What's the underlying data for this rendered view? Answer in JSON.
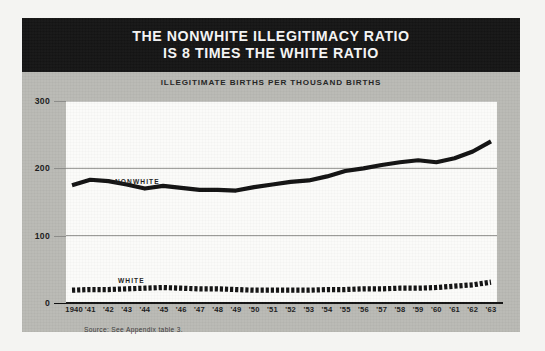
{
  "poster": {
    "title_line1": "THE NONWHITE ILLEGITIMACY RATIO",
    "title_line2": "IS 8 TIMES THE WHITE RATIO",
    "subhead": "ILLEGITIMATE BIRTHS PER THOUSAND BIRTHS",
    "source": "Source: See Appendix table 3.",
    "colors": {
      "plate": "#b9b9b4",
      "title_band": "#141414",
      "plot_background": "#fbfbf9",
      "line": "#111111",
      "grid": "#8d8d8a"
    }
  },
  "chart_data": {
    "type": "line",
    "title": "THE NONWHITE ILLEGITIMACY RATIO IS 8 TIMES THE WHITE RATIO",
    "subtitle": "ILLEGITIMATE BIRTHS PER THOUSAND BIRTHS",
    "xlabel": "",
    "ylabel": "ILLEGITIMATE BIRTHS PER THOUSAND BIRTHS",
    "x": [
      1940,
      1941,
      1942,
      1943,
      1944,
      1945,
      1946,
      1947,
      1948,
      1949,
      1950,
      1951,
      1952,
      1953,
      1954,
      1955,
      1956,
      1957,
      1958,
      1959,
      1960,
      1961,
      1962,
      1963
    ],
    "xtick_labels": [
      "1940",
      "'41",
      "'42",
      "'43",
      "'44",
      "'45",
      "'46",
      "'47",
      "'48",
      "'49",
      "'50",
      "'51",
      "'52",
      "'53",
      "'54",
      "'55",
      "'56",
      "'57",
      "'58",
      "'59",
      "'60",
      "'61",
      "'62",
      "'63"
    ],
    "ytick_labels": [
      "0",
      "100",
      "200",
      "300"
    ],
    "yticks": [
      0,
      100,
      200,
      300
    ],
    "ylim": [
      0,
      300
    ],
    "grid": true,
    "legend": "inline-labels",
    "series": [
      {
        "name": "NONWHITE",
        "style": "solid-thick",
        "values": [
          175,
          183,
          181,
          176,
          170,
          174,
          171,
          168,
          168,
          167,
          172,
          176,
          180,
          182,
          188,
          196,
          200,
          205,
          209,
          212,
          209,
          215,
          225,
          240
        ]
      },
      {
        "name": "WHITE",
        "style": "dashed-thick",
        "values": [
          19,
          20,
          20,
          21,
          22,
          23,
          22,
          21,
          21,
          20,
          19,
          19,
          19,
          19,
          20,
          20,
          21,
          21,
          22,
          22,
          23,
          25,
          27,
          31
        ]
      }
    ],
    "annotations": [
      {
        "text": "NONWHITE",
        "x": 1942.5,
        "y": 212
      },
      {
        "text": "WHITE",
        "x": 1943.0,
        "y": 58
      }
    ]
  }
}
